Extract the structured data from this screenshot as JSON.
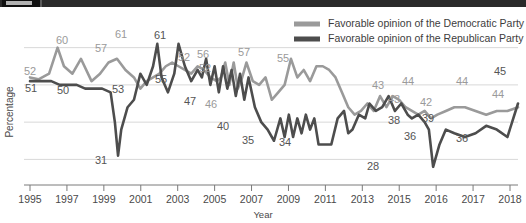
{
  "topbar": {
    "label": ""
  },
  "chart_data": {
    "type": "line",
    "title": "",
    "xlabel": "Year",
    "ylabel": "Percentage",
    "xlim": [
      1995,
      2018
    ],
    "ylim": [
      25,
      65
    ],
    "grid": true,
    "gridlines": [
      30,
      40,
      50,
      60
    ],
    "legend_position": "top-right",
    "xticks": [
      1995,
      1997,
      1999,
      2001,
      2003,
      2005,
      2007,
      2009,
      2011,
      2013,
      2015,
      2016,
      2017,
      2018
    ],
    "xtick_labels": [
      "1995",
      "1997",
      "1999",
      "2001",
      "2003",
      "2005",
      "2007",
      "2009",
      "2011",
      "2013",
      "2015",
      "2016",
      "2017",
      "2018"
    ],
    "colors": {
      "democratic": "#9a9a9a",
      "republican": "#4d4d4d",
      "grid": "#d8d8d8",
      "axis": "#7a7a7a"
    },
    "series": [
      {
        "name": "Favorable opinion of the Democratic Party",
        "color": "#9a9a9a",
        "x": [
          1995.0,
          1995.4,
          1995.9,
          1996.3,
          1996.6,
          1997.0,
          1997.4,
          1997.9,
          1998.3,
          1998.7,
          1999.1,
          1999.5,
          1999.9,
          2000.2,
          2000.5,
          2000.8,
          2001.1,
          2001.4,
          2001.7,
          2002.0,
          2002.3,
          2002.6,
          2002.9,
          2003.2,
          2003.5,
          2003.8,
          2004.0,
          2004.2,
          2004.4,
          2004.6,
          2004.8,
          2005.0,
          2005.2,
          2005.5,
          2005.8,
          2006.1,
          2006.4,
          2006.7,
          2007.0,
          2007.3,
          2007.6,
          2007.9,
          2008.2,
          2008.5,
          2008.8,
          2009.1,
          2009.4,
          2009.7,
          2010.0,
          2010.3,
          2010.6,
          2010.9,
          2011.2,
          2011.5,
          2011.8,
          2012.1,
          2012.4,
          2012.7,
          2013.0,
          2013.3,
          2013.6,
          2013.9,
          2014.2,
          2014.6,
          2015.0,
          2015.5,
          2016.0,
          2016.5,
          2017.0,
          2017.5,
          2018.0
        ],
        "y": [
          52,
          51.5,
          53,
          60,
          55,
          53,
          57,
          51,
          53,
          56,
          57,
          54,
          52,
          49,
          51,
          52,
          53,
          55,
          56,
          55,
          54,
          53,
          55,
          54,
          52,
          51,
          52,
          56,
          50,
          56,
          49,
          52,
          56,
          51,
          50,
          52,
          46,
          48,
          50,
          57,
          52,
          54,
          51,
          55,
          55,
          54,
          52,
          48,
          44,
          42,
          43,
          45,
          43,
          47,
          44,
          47,
          46,
          44,
          43,
          42,
          43,
          41,
          42,
          43,
          44,
          44,
          43,
          42,
          43,
          43,
          44
        ]
      },
      {
        "name": "Favorable opinion of the Republican Party",
        "color": "#4d4d4d",
        "x": [
          1995.0,
          1995.5,
          1996.0,
          1996.4,
          1996.8,
          1997.2,
          1997.6,
          1998.0,
          1998.4,
          1998.8,
          1999.0,
          1999.15,
          1999.3,
          1999.6,
          1999.9,
          2000.2,
          2000.5,
          2000.8,
          2001.0,
          2001.2,
          2001.5,
          2001.8,
          2002.0,
          2002.3,
          2002.6,
          2002.9,
          2003.1,
          2003.3,
          2003.5,
          2003.7,
          2003.9,
          2004.1,
          2004.3,
          2004.5,
          2004.7,
          2004.9,
          2005.1,
          2005.3,
          2005.6,
          2005.9,
          2006.2,
          2006.5,
          2006.8,
          2007.0,
          2007.2,
          2007.4,
          2007.6,
          2007.8,
          2008.0,
          2008.2,
          2008.4,
          2008.6,
          2008.8,
          2009.0,
          2009.2,
          2009.5,
          2009.8,
          2010.0,
          2010.2,
          2010.5,
          2010.8,
          2011.0,
          2011.3,
          2011.6,
          2011.9,
          2012.2,
          2012.5,
          2012.8,
          2013.0,
          2013.3,
          2013.6,
          2013.8,
          2014.0,
          2014.3,
          2014.6,
          2015.0,
          2015.5,
          2016.0,
          2016.5,
          2017.0,
          2017.5,
          2018.0
        ],
        "y": [
          51,
          51,
          51,
          50,
          50,
          50,
          49,
          49,
          49,
          48,
          40,
          31,
          38,
          44,
          46,
          53,
          50,
          55,
          61,
          52,
          48,
          53,
          61,
          55,
          51,
          54,
          52,
          57,
          50,
          55,
          48,
          55,
          49,
          54,
          47,
          53,
          46,
          52,
          44,
          40,
          38,
          35,
          41,
          36,
          42,
          36,
          41,
          37,
          42,
          38,
          41,
          34,
          34,
          34,
          34,
          41,
          43,
          37,
          38,
          42,
          41,
          45,
          43,
          44,
          47,
          43,
          45,
          42,
          41,
          42,
          40,
          38,
          28,
          34,
          38,
          37,
          36,
          37,
          39,
          38,
          36,
          45
        ]
      }
    ],
    "point_labels": [
      {
        "text": "52",
        "x": 30,
        "y": 68,
        "series": "democratic"
      },
      {
        "text": "60",
        "x": 62,
        "y": 37,
        "series": "democratic"
      },
      {
        "text": "57",
        "x": 101,
        "y": 45,
        "series": "democratic"
      },
      {
        "text": "61",
        "x": 121,
        "y": 31,
        "series": "democratic"
      },
      {
        "text": "61",
        "x": 160,
        "y": 32,
        "series": "republican"
      },
      {
        "text": "55",
        "x": 161,
        "y": 76,
        "series": "republican"
      },
      {
        "text": "52",
        "x": 184,
        "y": 54,
        "series": "democratic"
      },
      {
        "text": "56",
        "x": 203,
        "y": 51,
        "series": "democratic"
      },
      {
        "text": "52",
        "x": 205,
        "y": 65,
        "series": "democratic"
      },
      {
        "text": "47",
        "x": 190,
        "y": 98,
        "series": "republican"
      },
      {
        "text": "46",
        "x": 211,
        "y": 101,
        "series": "democratic"
      },
      {
        "text": "57",
        "x": 244,
        "y": 49,
        "series": "democratic"
      },
      {
        "text": "55",
        "x": 283,
        "y": 55,
        "series": "democratic"
      },
      {
        "text": "40",
        "x": 223,
        "y": 123,
        "series": "republican"
      },
      {
        "text": "35",
        "x": 248,
        "y": 137,
        "series": "republican"
      },
      {
        "text": "34",
        "x": 285,
        "y": 139,
        "series": "republican"
      },
      {
        "text": "51",
        "x": 31,
        "y": 85,
        "series": "republican"
      },
      {
        "text": "50",
        "x": 63,
        "y": 87,
        "series": "republican"
      },
      {
        "text": "53",
        "x": 118,
        "y": 86,
        "series": "republican"
      },
      {
        "text": "31",
        "x": 101,
        "y": 157,
        "series": "republican"
      },
      {
        "text": "28",
        "x": 373,
        "y": 163,
        "series": "republican"
      },
      {
        "text": "43",
        "x": 378,
        "y": 82,
        "series": "democratic"
      },
      {
        "text": "43",
        "x": 394,
        "y": 96,
        "series": "democratic"
      },
      {
        "text": "44",
        "x": 408,
        "y": 78,
        "series": "democratic"
      },
      {
        "text": "42",
        "x": 426,
        "y": 99,
        "series": "democratic"
      },
      {
        "text": "44",
        "x": 462,
        "y": 78,
        "series": "democratic"
      },
      {
        "text": "44",
        "x": 498,
        "y": 91,
        "series": "democratic"
      },
      {
        "text": "45",
        "x": 500,
        "y": 68,
        "series": "republican"
      },
      {
        "text": "38",
        "x": 394,
        "y": 117,
        "series": "republican"
      },
      {
        "text": "36",
        "x": 410,
        "y": 133,
        "series": "republican"
      },
      {
        "text": "39",
        "x": 428,
        "y": 115,
        "series": "republican"
      },
      {
        "text": "36",
        "x": 462,
        "y": 135,
        "series": "republican"
      }
    ]
  },
  "legend": {
    "items": [
      {
        "label": "Favorable opinion of the Democratic Party",
        "color": "#9a9a9a",
        "key": "democratic"
      },
      {
        "label": "Favorable opinion of the Republican Party",
        "color": "#4d4d4d",
        "key": "republican"
      }
    ]
  }
}
